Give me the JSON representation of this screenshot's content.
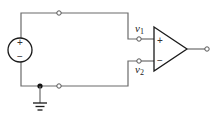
{
  "diagram": {
    "title": "",
    "source": {
      "plus": "+",
      "minus": "−"
    },
    "opamp": {
      "plus": "+",
      "minus": "−"
    },
    "labels": {
      "v1": {
        "main": "v",
        "sub": "1"
      },
      "v2": {
        "main": "v",
        "sub": "2"
      }
    },
    "colors": {
      "wire": "#6b6b6b",
      "component": "#1a1a1a",
      "node": "#111111"
    }
  }
}
